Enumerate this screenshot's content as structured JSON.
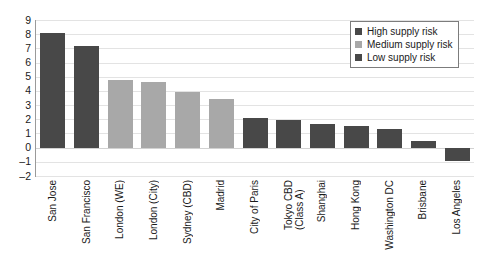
{
  "chart_data": {
    "type": "bar",
    "title": "",
    "subtitle": "",
    "xlabel": "",
    "ylabel": "",
    "ylim": [
      -2,
      9
    ],
    "ytick_step": 1,
    "yticks": [
      "9",
      "8",
      "7",
      "6",
      "5",
      "4",
      "3",
      "2",
      "1",
      "0",
      "-1",
      "-2"
    ],
    "grid": true,
    "grid_axis": "y",
    "legend_position": "top-right",
    "categories": [
      "San Jose",
      "San Francisco",
      "London (WE)",
      "London (City)",
      "Sydney (CBD)",
      "Madrid",
      "City of Paris",
      "Tokyo CBD\n(Class A)",
      "Shanghai",
      "Hong Kong",
      "Washington DC",
      "Brisbane",
      "Los Angeles"
    ],
    "values": [
      8.1,
      7.2,
      4.75,
      4.6,
      3.95,
      3.4,
      2.1,
      1.95,
      1.7,
      1.55,
      1.3,
      0.5,
      -0.95
    ],
    "groups": [
      "High supply risk",
      "High supply risk",
      "Medium supply risk",
      "Medium supply risk",
      "Medium supply risk",
      "Medium supply risk",
      "Low supply risk",
      "Low supply risk",
      "Low supply risk",
      "Low supply risk",
      "Low supply risk",
      "Low supply risk",
      "Low supply risk"
    ],
    "legend": [
      {
        "label": "High supply risk",
        "color": "#484848"
      },
      {
        "label": "Medium supply risk",
        "color": "#a8a8a8"
      },
      {
        "label": "Low supply risk",
        "color": "#484848"
      }
    ],
    "colors": {
      "high": "#484848",
      "medium": "#a8a8a8",
      "low": "#484848",
      "grid": "#e3e3e3",
      "axis": "#9a9a9a",
      "background": "#ffffff"
    }
  }
}
